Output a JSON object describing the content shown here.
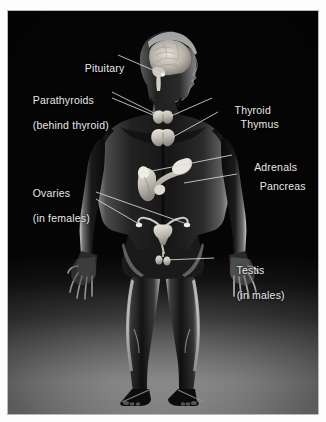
{
  "figure": {
    "background_color": "#050505",
    "mount_color": "#fdfdfd",
    "label_color": "#e8e8e8",
    "leader_line_color": "#d8d8d8"
  },
  "labels": [
    {
      "id": "pituitary",
      "text": "Pituitary",
      "text2": "",
      "side": "left"
    },
    {
      "id": "parathyroids",
      "text": "Parathyroids",
      "text2": "(behind thyroid)",
      "side": "left"
    },
    {
      "id": "thyroid",
      "text": "Thyroid",
      "text2": "",
      "side": "right"
    },
    {
      "id": "thymus",
      "text": "Thymus",
      "text2": "",
      "side": "right"
    },
    {
      "id": "adrenals",
      "text": "Adrenals",
      "text2": "",
      "side": "right"
    },
    {
      "id": "pancreas",
      "text": "Pancreas",
      "text2": "",
      "side": "right"
    },
    {
      "id": "ovaries",
      "text": "Ovaries",
      "text2": "(in females)",
      "side": "left"
    },
    {
      "id": "testis",
      "text": "Testis",
      "text2": "(in males)",
      "side": "right"
    }
  ],
  "organs": [
    {
      "id": "brain",
      "name": "brain-sagittal-section"
    },
    {
      "id": "thyroid",
      "name": "thyroid-gland-butterfly"
    },
    {
      "id": "thymus",
      "name": "thymus-gland-butterfly"
    },
    {
      "id": "adrenals",
      "name": "adrenal-gland-with-kidney"
    },
    {
      "id": "pancreas",
      "name": "pancreas-elongated"
    },
    {
      "id": "uterus",
      "name": "uterus-with-ovaries-and-fallopian-tubes"
    },
    {
      "id": "testis",
      "name": "testis-pair"
    }
  ]
}
